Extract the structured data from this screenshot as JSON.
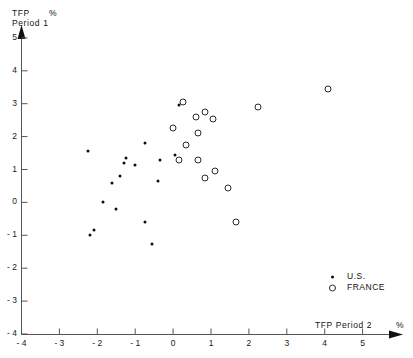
{
  "chart_data": {
    "type": "scatter",
    "title": "",
    "xlabel": "TFP Period 2",
    "ylabel": "TFP Period 1",
    "x_unit": "%",
    "y_unit": "%",
    "xlim": [
      -4,
      5
    ],
    "ylim": [
      -4,
      5
    ],
    "grid": false,
    "legend_position": "bottom-right",
    "xticks": [
      -4,
      -3,
      -2,
      -1,
      0,
      1,
      2,
      3,
      4,
      5
    ],
    "xtick_labels": [
      "- 4",
      "- 3",
      "- 2",
      "- 1",
      "0",
      "1",
      "2",
      "3",
      "4",
      "5"
    ],
    "yticks": [
      -4,
      -3,
      -2,
      -1,
      0,
      1,
      2,
      3,
      4,
      5
    ],
    "ytick_labels": [
      "- 4",
      "- 3",
      "- 2",
      "- 1",
      "0",
      "1",
      "2",
      "3",
      "4",
      "5"
    ],
    "series": [
      {
        "name": "U.S.",
        "marker": "dot",
        "color": "#0d0d0d",
        "points": [
          [
            -2.25,
            1.55
          ],
          [
            -1.25,
            1.35
          ],
          [
            -1.3,
            1.2
          ],
          [
            -1.0,
            1.15
          ],
          [
            -1.4,
            0.8
          ],
          [
            -1.6,
            0.6
          ],
          [
            -1.85,
            0.0
          ],
          [
            -2.1,
            -0.85
          ],
          [
            -0.75,
            1.8
          ],
          [
            -0.35,
            1.3
          ],
          [
            -0.4,
            0.65
          ],
          [
            -0.75,
            -0.6
          ],
          [
            -0.55,
            -1.25
          ],
          [
            -1.5,
            -0.2
          ],
          [
            -2.2,
            -1.0
          ],
          [
            0.15,
            2.95
          ],
          [
            0.05,
            1.45
          ]
        ]
      },
      {
        "name": "FRANCE",
        "marker": "circle",
        "color": "#2a2a2a",
        "points": [
          [
            0.25,
            3.05
          ],
          [
            0.6,
            2.6
          ],
          [
            0.85,
            2.75
          ],
          [
            1.05,
            2.55
          ],
          [
            0.0,
            2.25
          ],
          [
            0.65,
            2.1
          ],
          [
            0.35,
            1.75
          ],
          [
            0.15,
            1.3
          ],
          [
            0.65,
            1.3
          ],
          [
            1.1,
            0.95
          ],
          [
            0.85,
            0.75
          ],
          [
            1.45,
            0.45
          ],
          [
            1.65,
            -0.6
          ],
          [
            2.25,
            2.9
          ],
          [
            4.1,
            3.45
          ]
        ]
      }
    ]
  },
  "axis": {
    "y_label_line1": "TFP",
    "y_label_line2": "Period 1",
    "y_percent": "%",
    "x_label": "TFP  Period 2",
    "x_percent": "%"
  },
  "legend": {
    "items": [
      {
        "label": "U.S.",
        "marker": "dot"
      },
      {
        "label": "FRANCE",
        "marker": "circle"
      }
    ]
  }
}
